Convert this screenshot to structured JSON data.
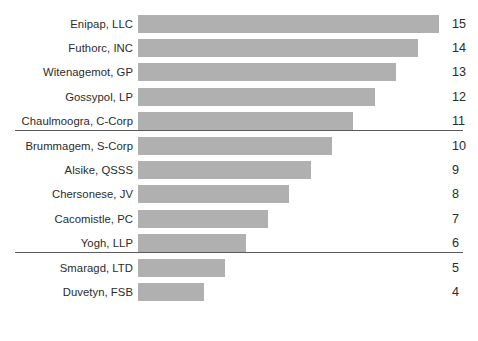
{
  "chart_data": {
    "type": "bar",
    "orientation": "horizontal",
    "title": "",
    "subtitle": "",
    "xlabel": "",
    "ylabel": "",
    "grid": false,
    "legend": null,
    "axis_visible": false,
    "xlim": [
      0,
      15
    ],
    "categories": [
      "Enipap, LLC",
      "Futhorc, INC",
      "Witenagemot, GP",
      "Gossypol, LP",
      "Chaulmoogra, C-Corp",
      "Brummagem, S-Corp",
      "Alsike, QSSS",
      "Chersonese, JV",
      "Cacomistle, PC",
      "Yogh, LLP",
      "Smaragd, LTD",
      "Duvetyn, FSB"
    ],
    "values": [
      15,
      14,
      13,
      12,
      11,
      10,
      9,
      8,
      7,
      6,
      5,
      4
    ],
    "value_labels": [
      "15",
      "14",
      "13",
      "12",
      "11",
      "10",
      "9",
      "8",
      "7",
      "6",
      "5",
      "4"
    ],
    "bar_color": "#b0b0b0",
    "text_color": "#2b2b2b",
    "background_color": "#ffffff",
    "separator_color": "#5a5a5a",
    "separators_after_category": [
      "Chaulmoogra, C-Corp",
      "Yogh, LLP"
    ],
    "groups": [
      {
        "rows": [
          "Enipap, LLC",
          "Futhorc, INC",
          "Witenagemot, GP",
          "Gossypol, LP",
          "Chaulmoogra, C-Corp"
        ]
      },
      {
        "rows": [
          "Brummagem, S-Corp",
          "Alsike, QSSS",
          "Chersonese, JV",
          "Cacomistle, PC",
          "Yogh, LLP"
        ]
      },
      {
        "rows": [
          "Smaragd, LTD",
          "Duvetyn, FSB"
        ]
      }
    ]
  }
}
